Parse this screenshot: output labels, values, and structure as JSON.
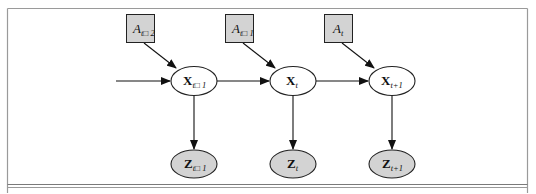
{
  "figure": {
    "type": "graphical-model",
    "colors": {
      "frame": "#9a9a9a",
      "shaded_fill": "#d3d3d3",
      "unshaded_fill": "#ffffff",
      "edge": "#111111"
    }
  },
  "nodes": {
    "action": [
      {
        "id": "A_t-2",
        "base": "A",
        "sub": "t□ 2",
        "cx": 140.5,
        "cy": 28,
        "shape": "box",
        "shaded": true
      },
      {
        "id": "A_t-1",
        "base": "A",
        "sub": "t□ 1",
        "cx": 239.5,
        "cy": 28,
        "shape": "box",
        "shaded": true
      },
      {
        "id": "A_t",
        "base": "A",
        "sub": "t",
        "cx": 338.5,
        "cy": 28,
        "shape": "box",
        "shaded": true
      }
    ],
    "state": [
      {
        "id": "X_t-1",
        "base": "X",
        "sub": "t□ 1",
        "cx": 194,
        "cy": 81,
        "shape": "ellipse",
        "shaded": false
      },
      {
        "id": "X_t",
        "base": "X",
        "sub": "t",
        "cx": 293,
        "cy": 81,
        "shape": "ellipse",
        "shaded": false
      },
      {
        "id": "X_t+1",
        "base": "X",
        "sub": "t+1",
        "cx": 392,
        "cy": 81,
        "shape": "ellipse",
        "shaded": false
      }
    ],
    "observation": [
      {
        "id": "Z_t-1",
        "base": "Z",
        "sub": "t□ 1",
        "cx": 194,
        "cy": 164,
        "shape": "ellipse",
        "shaded": true
      },
      {
        "id": "Z_t",
        "base": "Z",
        "sub": "t",
        "cx": 293,
        "cy": 164,
        "shape": "ellipse",
        "shaded": true
      },
      {
        "id": "Z_t+1",
        "base": "Z",
        "sub": "t+1",
        "cx": 392,
        "cy": 164,
        "shape": "ellipse",
        "shaded": true
      }
    ]
  },
  "edges": [
    {
      "from": "input",
      "to": "X_t-1"
    },
    {
      "from": "A_t-2",
      "to": "X_t-1"
    },
    {
      "from": "A_t-1",
      "to": "X_t"
    },
    {
      "from": "A_t",
      "to": "X_t+1"
    },
    {
      "from": "X_t-1",
      "to": "X_t"
    },
    {
      "from": "X_t",
      "to": "X_t+1"
    },
    {
      "from": "X_t-1",
      "to": "Z_t-1"
    },
    {
      "from": "X_t",
      "to": "Z_t"
    },
    {
      "from": "X_t+1",
      "to": "Z_t+1"
    }
  ],
  "labels": {
    "a_tm2": {
      "base": "A",
      "sub": "t□ 2"
    },
    "a_tm1": {
      "base": "A",
      "sub": "t□ 1"
    },
    "a_t": {
      "base": "A",
      "sub": "t"
    },
    "x_tm1": {
      "base": "X",
      "sub": "t□ 1"
    },
    "x_t": {
      "base": "X",
      "sub": "t"
    },
    "x_tp1": {
      "base": "X",
      "sub": "t+1"
    },
    "z_tm1": {
      "base": "Z",
      "sub": "t□ 1"
    },
    "z_t": {
      "base": "Z",
      "sub": "t"
    },
    "z_tp1": {
      "base": "Z",
      "sub": "t+1"
    }
  }
}
